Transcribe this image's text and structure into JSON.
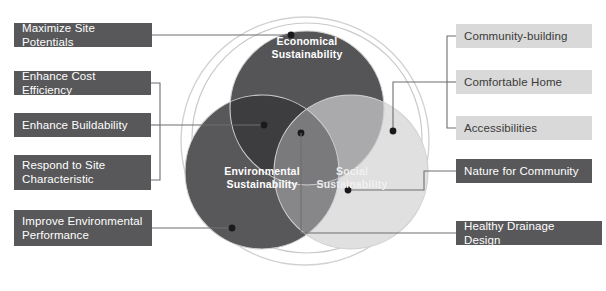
{
  "diagram": {
    "circles": [
      {
        "id": "economical",
        "label": "Economical\nSustainability",
        "color": "#555557",
        "cx": 307,
        "cy": 108,
        "r": 77
      },
      {
        "id": "environmental",
        "label": "Environmental\nSustainability",
        "color": "#58585a",
        "cx": 262,
        "cy": 172,
        "r": 77
      },
      {
        "id": "social",
        "label": "Social\nSustainability",
        "color": "#e0e0e0",
        "cx": 351,
        "cy": 172,
        "r": 77
      }
    ],
    "overlap_colors": {
      "economical_environmental": "#3d3d3f",
      "economical_social": "#aaaaac",
      "environmental_social": "#87878a",
      "center_all": "#7a7a7c"
    },
    "outer_ring": {
      "cx": 305,
      "cy": 141,
      "r": 124,
      "color": "#d2d2d2"
    },
    "leader_line_color": "#6e6e70",
    "node_color": "#1a1a1a"
  },
  "left_labels": [
    {
      "id": "maximize-site-potentials",
      "text": "Maximize Site Potentials",
      "style": "dark"
    },
    {
      "id": "enhance-cost-efficiency",
      "text": "Enhance Cost Efficiency",
      "style": "dark"
    },
    {
      "id": "enhance-buildability",
      "text": "Enhance Buildability",
      "style": "dark"
    },
    {
      "id": "respond-to-site-characteristic",
      "text": "Respond to Site\nCharacteristic",
      "style": "dark"
    },
    {
      "id": "improve-environmental-performance",
      "text": "Improve Environmental\nPerformance",
      "style": "dark"
    }
  ],
  "right_labels": [
    {
      "id": "community-building",
      "text": "Community-building",
      "style": "light"
    },
    {
      "id": "comfortable-home",
      "text": "Comfortable Home",
      "style": "light"
    },
    {
      "id": "accessibilities",
      "text": "Accessibilities",
      "style": "light"
    },
    {
      "id": "nature-for-community",
      "text": "Nature for Community",
      "style": "dark"
    },
    {
      "id": "healthy-drainage-design",
      "text": "Healthy Drainage Design",
      "style": "dark"
    }
  ]
}
